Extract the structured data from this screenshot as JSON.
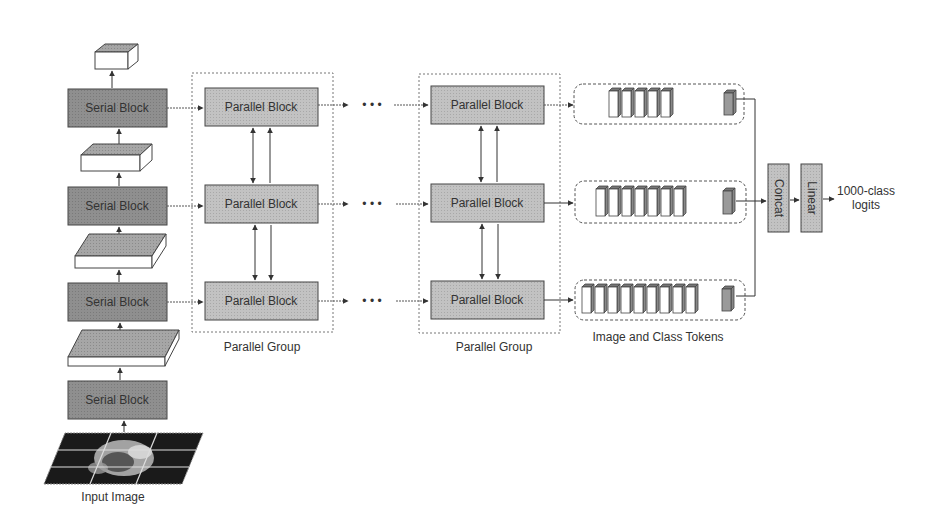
{
  "diagram": {
    "colors": {
      "serial_block_fill": "#8f8f8f",
      "parallel_block_fill": "#bdbdbd",
      "op_block_fill": "#b5b5b5",
      "border": "#444444",
      "background": "#ffffff",
      "token_fill": "#ffffff",
      "class_token_fill": "#9a9a9a"
    },
    "serial_stack": {
      "blocks": [
        {
          "label": "Serial Block"
        },
        {
          "label": "Serial Block"
        },
        {
          "label": "Serial Block"
        },
        {
          "label": "Serial Block"
        }
      ],
      "input_label": "Input Image"
    },
    "parallel_groups": [
      {
        "label": "Parallel Group",
        "blocks": [
          {
            "label": "Parallel Block"
          },
          {
            "label": "Parallel Block"
          },
          {
            "label": "Parallel Block"
          }
        ]
      },
      {
        "label": "Parallel Group",
        "blocks": [
          {
            "label": "Parallel Block"
          },
          {
            "label": "Parallel Block"
          },
          {
            "label": "Parallel Block"
          }
        ]
      }
    ],
    "ellipsis": "• • •",
    "tokens": {
      "label": "Image and Class Tokens",
      "rows": [
        {
          "image_tokens": 5,
          "class_tokens": 1
        },
        {
          "image_tokens": 7,
          "class_tokens": 1
        },
        {
          "image_tokens": 9,
          "class_tokens": 1
        }
      ]
    },
    "head": {
      "concat_label": "Concat",
      "linear_label": "Linear",
      "output_line1": "1000-class",
      "output_line2": "logits"
    }
  }
}
